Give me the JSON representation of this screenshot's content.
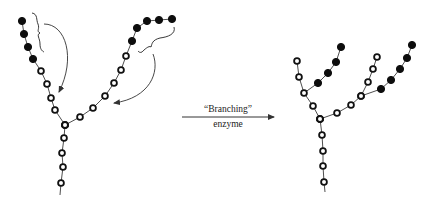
{
  "figure": {
    "reaction_arrow": {
      "label_top": "“Branching”",
      "label_bottom": "enzyme",
      "x1": 182,
      "x2": 274,
      "y": 117
    },
    "colors": {
      "open_residue": "#ffffff",
      "filled_residue": "#0d0d0d",
      "stroke": "#111111"
    },
    "before": {
      "description": "Glycogen chain before branching; filled residues mark segments to be transferred",
      "stem": [
        [
          65,
          125
        ],
        [
          64,
          138
        ],
        [
          62,
          153
        ],
        [
          63,
          167
        ],
        [
          61,
          183
        ]
      ],
      "stem_tail": [
        60,
        195
      ],
      "left_arm": {
        "open": [
          [
            65,
            125
          ],
          [
            55,
            110
          ],
          [
            51,
            98
          ],
          [
            47,
            84
          ],
          [
            41,
            71
          ]
        ],
        "filled": [
          [
            33,
            59
          ],
          [
            28,
            47
          ],
          [
            24,
            34
          ],
          [
            22,
            21
          ]
        ]
      },
      "right_arm": {
        "open": [
          [
            65,
            125
          ],
          [
            80,
            117
          ],
          [
            93,
            108
          ],
          [
            105,
            96
          ],
          [
            114,
            83
          ],
          [
            121,
            70
          ],
          [
            126,
            56
          ]
        ],
        "filled": [
          [
            132,
            41
          ],
          [
            137,
            28
          ],
          [
            147,
            21
          ],
          [
            159,
            20
          ],
          [
            172,
            19
          ]
        ]
      }
    },
    "after": {
      "description": "Glycogen chain after branching; transferred segments attached as new branches",
      "stem": [
        [
          320,
          119
        ],
        [
          322,
          135
        ],
        [
          323,
          151
        ],
        [
          323,
          166
        ],
        [
          324,
          182
        ]
      ],
      "stem_tail": [
        325,
        192
      ],
      "left_arm": {
        "open": [
          [
            320,
            119
          ],
          [
            313,
            106
          ],
          [
            304,
            93
          ],
          [
            299,
            77
          ],
          [
            297,
            61
          ]
        ]
      },
      "left_branch": {
        "filled": [
          [
            304,
            93
          ],
          [
            318,
            83
          ],
          [
            328,
            73
          ],
          [
            336,
            62
          ],
          [
            341,
            47
          ]
        ]
      },
      "right_arm": {
        "open": [
          [
            320,
            119
          ],
          [
            337,
            113
          ],
          [
            351,
            105
          ],
          [
            361,
            96
          ]
        ],
        "filled": [
          [
            381,
            89
          ],
          [
            391,
            80
          ],
          [
            400,
            69
          ],
          [
            407,
            58
          ],
          [
            412,
            45
          ]
        ]
      },
      "inner_branch": {
        "open": [
          [
            361,
            96
          ],
          [
            368,
            82
          ],
          [
            373,
            69
          ],
          [
            377,
            57
          ]
        ]
      }
    }
  }
}
